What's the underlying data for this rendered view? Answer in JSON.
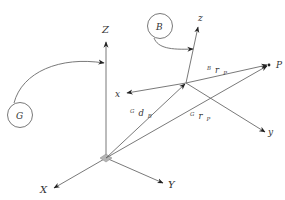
{
  "diagram": {
    "type": "coordinate-frames",
    "colors": {
      "line": "#6a6a6a",
      "text": "#333333",
      "origin_marker": "#b5b5b5"
    },
    "global_frame": {
      "name": "G",
      "axes": {
        "X": "X",
        "Y": "Y",
        "Z": "Z"
      }
    },
    "body_frame": {
      "name": "B",
      "axes": {
        "x": "x",
        "y": "y",
        "z": "z"
      }
    },
    "point": {
      "label": "P"
    },
    "vectors": {
      "gdb": {
        "pre": "G",
        "main": "d",
        "sub": "B"
      },
      "grp": {
        "pre": "G",
        "main": "r",
        "sub": "P"
      },
      "brp": {
        "pre": "B",
        "main": "r",
        "sub": "P"
      }
    }
  }
}
